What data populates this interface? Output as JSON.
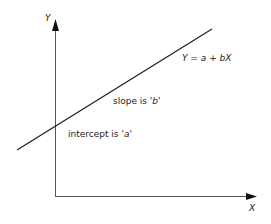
{
  "diagram": {
    "axes": {
      "y_label": "Y",
      "x_label": "X"
    },
    "line": {
      "equation": "Y = a + bX"
    },
    "annotations": {
      "slope_prefix": "slope is '",
      "slope_var": "b",
      "slope_suffix": "'",
      "intercept_prefix": "intercept is '",
      "intercept_var": "a",
      "intercept_suffix": "'"
    },
    "colors": {
      "axis": "#555555",
      "line": "#222222",
      "text": "#222222"
    }
  }
}
